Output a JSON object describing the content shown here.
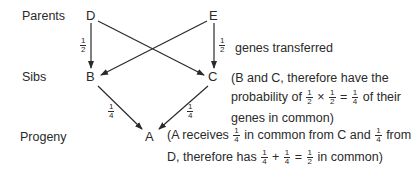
{
  "row_labels": {
    "parents": "Parents",
    "sibs": "Sibs",
    "progeny": "Progeny"
  },
  "nodes": {
    "D": "D",
    "E": "E",
    "B": "B",
    "C": "C",
    "A": "A"
  },
  "edge_fractions": {
    "D_to_B": {
      "num": "1",
      "den": "2"
    },
    "E_to_C": {
      "num": "1",
      "den": "2"
    },
    "B_to_A": {
      "num": "1",
      "den": "4"
    },
    "C_to_A": {
      "num": "1",
      "den": "4"
    }
  },
  "annotations": {
    "genes_transferred": "genes transferred",
    "sibs_note": {
      "line1": "(B and C, therefore have the",
      "line2_prefix": "probability of",
      "f1": {
        "num": "1",
        "den": "2"
      },
      "times": "×",
      "f2": {
        "num": "1",
        "den": "2"
      },
      "eq": "=",
      "f3": {
        "num": "1",
        "den": "4"
      },
      "line2_suffix": "of their",
      "line3": "genes in common)"
    },
    "progeny_note": {
      "line1_prefix": "(A receives",
      "f1": {
        "num": "1",
        "den": "4"
      },
      "line1_mid": "in common from C and",
      "f2": {
        "num": "1",
        "den": "4"
      },
      "line1_suffix": "from",
      "line2_prefix": "D, therefore has",
      "f3": {
        "num": "1",
        "den": "4"
      },
      "plus": "+",
      "f4": {
        "num": "1",
        "den": "4"
      },
      "eq": "=",
      "f5": {
        "num": "1",
        "den": "2"
      },
      "line2_suffix": "in common)"
    }
  },
  "colors": {
    "ink": "#2a2a2a",
    "background": "#ffffff"
  }
}
